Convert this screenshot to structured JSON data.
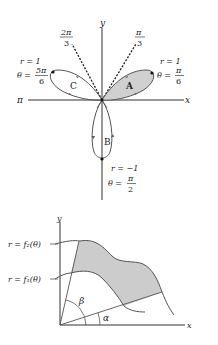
{
  "top_figure": {
    "axis_labels": {
      "x": "x",
      "y": "y",
      "neg_x": "π"
    },
    "ray_labels": [
      {
        "num": "π",
        "den": "3"
      },
      {
        "num": "2π",
        "den": "3"
      }
    ],
    "petals": [
      {
        "name": "A",
        "shaded": true
      },
      {
        "name": "B",
        "shaded": false
      },
      {
        "name": "C",
        "shaded": false
      }
    ],
    "point_labels": {
      "right": {
        "r": "r = 1",
        "theta_pre": "θ =",
        "num": "π",
        "den": "6"
      },
      "left": {
        "r": "r = 1",
        "theta_pre": "θ =",
        "num": "5π",
        "den": "6"
      },
      "bottom": {
        "r": "r = −1",
        "theta_pre": "θ =",
        "num": "π",
        "den": "2"
      }
    },
    "colors": {
      "shade": "#d0d0d0",
      "curve": "#555555",
      "axis": "#333333"
    }
  },
  "bottom_figure": {
    "axis_labels": {
      "x": "x",
      "y": "y"
    },
    "curve_labels": {
      "f2": "r = f₂(θ)",
      "f1": "r = f₁(θ)"
    },
    "angle_labels": {
      "beta": "β",
      "alpha": "α"
    },
    "colors": {
      "shade": "#cccccc"
    }
  }
}
